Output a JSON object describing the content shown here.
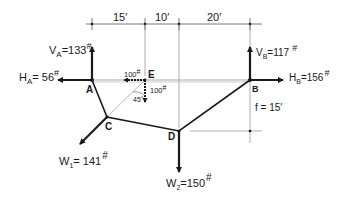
{
  "diagram": {
    "type": "funicular cable/truss force diagram",
    "dimensions": {
      "spans": [
        "15′",
        "10′",
        "20′"
      ],
      "sag": "f = 15′"
    },
    "nodes": {
      "A": "A",
      "B": "B",
      "C": "C",
      "D": "D",
      "E": "E"
    },
    "forces": {
      "VA": {
        "symbol": "V",
        "sub": "A",
        "value": "=133",
        "unit": "#"
      },
      "HA": {
        "symbol": "H",
        "sub": "A",
        "value": "= 56",
        "unit": "#"
      },
      "VB": {
        "symbol": "V",
        "sub": "B",
        "value": "=117",
        "unit": "#"
      },
      "HB": {
        "symbol": "H",
        "sub": "B",
        "value": "=156",
        "unit": "#"
      },
      "W1": {
        "symbol": "W",
        "sub": "1",
        "value": "= 141",
        "unit": "#"
      },
      "W2": {
        "symbol": "W",
        "sub": "2",
        "value": "=150",
        "unit": "#"
      },
      "E_horizontal": {
        "value": "100",
        "unit": "#"
      },
      "E_vertical": {
        "value": "100",
        "unit": "#"
      },
      "angle": "45°"
    },
    "colors": {
      "ink": "#1a1a1a",
      "thin_line": "#555555",
      "background": "#ffffff"
    }
  }
}
